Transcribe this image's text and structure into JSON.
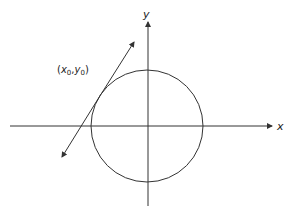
{
  "diagram": {
    "axes": {
      "x_label": "x",
      "y_label": "y"
    },
    "point_label": {
      "x": "x",
      "x_sub": "0",
      "comma": ",",
      "y": "y",
      "y_sub": "0",
      "open": "(",
      "close": ")"
    },
    "circle": {
      "cx": 147,
      "cy": 126,
      "r": 56
    },
    "tangent_line": {
      "from": [
        62,
        157
      ],
      "to": [
        134,
        42
      ]
    },
    "stroke_color": "#333333"
  }
}
